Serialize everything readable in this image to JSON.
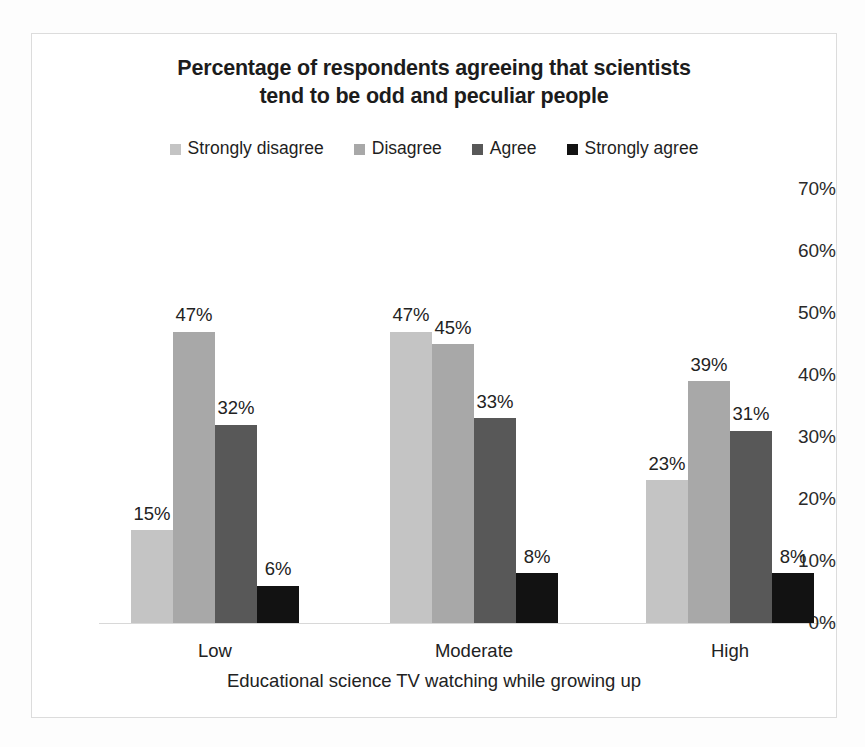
{
  "chart_data": {
    "type": "bar",
    "title": "Percentage of respondents agreeing that scientists tend to be odd and peculiar people",
    "title_lines": [
      "Percentage of respondents agreeing that scientists",
      "tend to be odd and peculiar people"
    ],
    "xlabel": "Educational science TV watching while growing up",
    "ylabel": "",
    "categories": [
      "Low",
      "Moderate",
      "High"
    ],
    "series": [
      {
        "name": "Strongly disagree",
        "color": "#c4c4c4",
        "values": [
          15,
          47,
          23
        ],
        "labels": [
          "15%",
          "47%",
          "23%"
        ]
      },
      {
        "name": "Disagree",
        "color": "#a8a8a8",
        "values": [
          47,
          45,
          39
        ],
        "labels": [
          "47%",
          "45%",
          "39%"
        ]
      },
      {
        "name": "Agree",
        "color": "#585858",
        "values": [
          32,
          33,
          31
        ],
        "labels": [
          "32%",
          "33%",
          "31%"
        ]
      },
      {
        "name": "Strongly agree",
        "color": "#121212",
        "values": [
          6,
          8,
          8
        ],
        "labels": [
          "6%",
          "8%",
          "8%"
        ]
      }
    ],
    "ylim": [
      0,
      70
    ],
    "ytick_values": [
      0,
      10,
      20,
      30,
      40,
      50,
      60,
      70
    ],
    "ytick_labels": [
      "0%",
      "10%",
      "20%",
      "30%",
      "40%",
      "50%",
      "60%",
      "70%"
    ],
    "grid": false,
    "legend_position": "top",
    "bar_value_labels": true,
    "border_color": "#dcdcdc",
    "axis_color": "#d8d8d8"
  }
}
